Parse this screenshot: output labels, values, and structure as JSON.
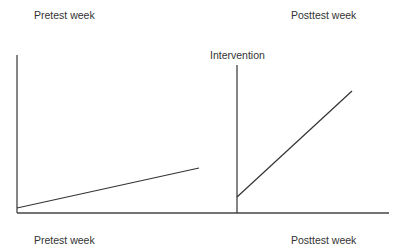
{
  "diagram": {
    "type": "interrupted-time-series-schematic",
    "labels": {
      "top_left": "Pretest week",
      "top_right": "Posttest week",
      "intervention": "Intervention",
      "bottom_left": "Pretest week",
      "bottom_right": "Posttest week"
    },
    "colors": {
      "axis": "#444444",
      "line": "#333333",
      "text": "#333333",
      "background": "#ffffff"
    },
    "geometry": {
      "y_axis": {
        "x": 17,
        "y1": 55,
        "y2": 213
      },
      "x_axis": {
        "y": 213,
        "x1": 17,
        "x2": 389
      },
      "intervention_line": {
        "x": 237,
        "y1": 65,
        "y2": 213
      },
      "pretest_segment": {
        "x1": 17,
        "y1": 208,
        "x2": 199,
        "y2": 168
      },
      "posttest_segment": {
        "x1": 237,
        "y1": 197,
        "x2": 352,
        "y2": 91
      }
    }
  }
}
